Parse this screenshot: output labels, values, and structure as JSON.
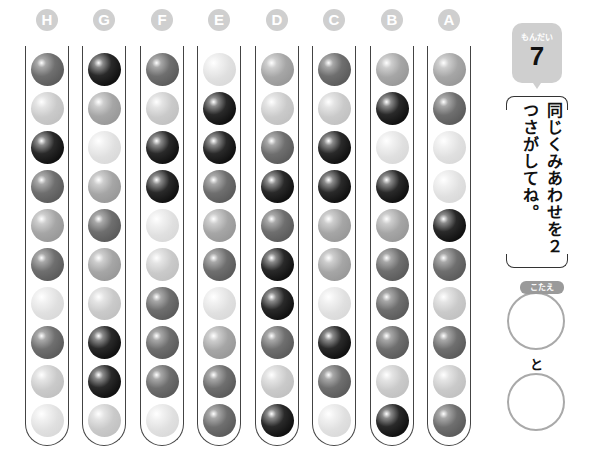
{
  "puzzle": {
    "problem_label": "もんだい",
    "problem_number": "7",
    "instruction": "同じくみあわせを２つさがしてね。",
    "answer_label": "こたえ",
    "connector": "と",
    "answer_slots": [
      "",
      ""
    ]
  },
  "shade_legend": {
    "K": "black",
    "D": "dark-gray",
    "M": "medium-gray",
    "L": "light-gray",
    "W": "very-light-gray"
  },
  "tubes": [
    {
      "label": "H",
      "balls": [
        "D",
        "L",
        "K",
        "D",
        "M",
        "D",
        "W",
        "D",
        "L",
        "W"
      ]
    },
    {
      "label": "G",
      "balls": [
        "K",
        "M",
        "W",
        "M",
        "D",
        "M",
        "L",
        "K",
        "K",
        "L"
      ]
    },
    {
      "label": "F",
      "balls": [
        "D",
        "L",
        "K",
        "K",
        "W",
        "L",
        "D",
        "D",
        "D",
        "W"
      ]
    },
    {
      "label": "E",
      "balls": [
        "W",
        "K",
        "K",
        "D",
        "M",
        "D",
        "W",
        "M",
        "D",
        "D"
      ]
    },
    {
      "label": "D",
      "balls": [
        "M",
        "L",
        "D",
        "K",
        "D",
        "K",
        "K",
        "D",
        "L",
        "K"
      ]
    },
    {
      "label": "C",
      "balls": [
        "D",
        "L",
        "K",
        "K",
        "M",
        "M",
        "W",
        "K",
        "D",
        "W"
      ]
    },
    {
      "label": "B",
      "balls": [
        "M",
        "K",
        "W",
        "K",
        "M",
        "D",
        "D",
        "D",
        "L",
        "K"
      ]
    },
    {
      "label": "A",
      "balls": [
        "M",
        "D",
        "W",
        "W",
        "K",
        "D",
        "L",
        "D",
        "L",
        "D"
      ]
    }
  ]
}
